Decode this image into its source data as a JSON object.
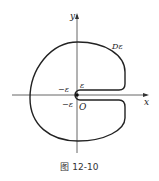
{
  "figure": {
    "caption": "图 12-10",
    "labels": {
      "y_axis": "y",
      "x_axis": "x",
      "region": "Dε",
      "origin": "O",
      "eps_top": "ε",
      "neg_eps_left": "−ε",
      "neg_eps_bottom": "−ε"
    },
    "colors": {
      "stroke": "#222222",
      "axis": "#555555"
    }
  }
}
